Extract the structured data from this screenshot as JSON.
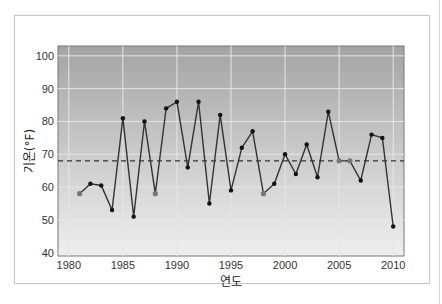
{
  "chart_data": {
    "type": "line",
    "title": "",
    "xlabel": "연도",
    "ylabel": "기온(°F)",
    "xlim": [
      1979,
      2011
    ],
    "ylim": [
      39,
      103
    ],
    "x_ticks": [
      1980,
      1985,
      1990,
      1995,
      2000,
      2005,
      2010
    ],
    "y_ticks": [
      40,
      50,
      60,
      70,
      80,
      90,
      100
    ],
    "grid": true,
    "reference_line": {
      "value": 68,
      "style": "dashed",
      "label": ""
    },
    "series": [
      {
        "name": "기온",
        "x": [
          1981,
          1982,
          1983,
          1984,
          1985,
          1986,
          1987,
          1988,
          1989,
          1990,
          1991,
          1992,
          1993,
          1994,
          1995,
          1996,
          1997,
          1998,
          1999,
          2000,
          2001,
          2002,
          2003,
          2004,
          2005,
          2006,
          2007,
          2008,
          2009,
          2010
        ],
        "values": [
          58,
          61,
          60.5,
          53,
          81,
          51,
          80,
          58,
          84,
          86,
          66,
          86,
          55,
          82,
          59,
          72,
          77,
          58,
          61,
          70,
          64,
          73,
          63,
          83,
          68,
          68,
          62,
          76,
          75,
          48
        ],
        "highlighted_points": [
          1981,
          1988,
          1998,
          2005,
          2006
        ]
      }
    ]
  },
  "colors": {
    "plot_top": "#a4a4a4",
    "plot_bottom": "#efefef",
    "line": "#333333",
    "marker": "#111111",
    "highlight_marker": "#777777",
    "grid": "#e6e6e6"
  }
}
